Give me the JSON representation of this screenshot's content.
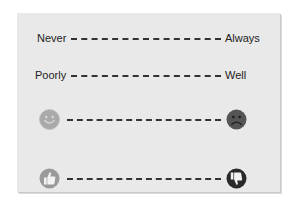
{
  "scales": [
    {
      "left_label": "Never",
      "right_label": "Always",
      "type": "text"
    },
    {
      "left_label": "Poorly",
      "right_label": "Well",
      "type": "text"
    },
    {
      "left_icon": "smiley-face-icon",
      "right_icon": "sad-face-icon",
      "type": "icon"
    },
    {
      "left_icon": "thumbs-up-icon",
      "right_icon": "thumbs-down-icon",
      "type": "icon"
    }
  ],
  "colors": {
    "panel_background": "#e9e9e9",
    "text": "#222222",
    "dash": "#333333",
    "smiley": "#a9a9a9",
    "sad": "#555555",
    "thumbs_up_bg": "#9a9a9a",
    "thumbs_down_bg": "#2a2a2a"
  }
}
